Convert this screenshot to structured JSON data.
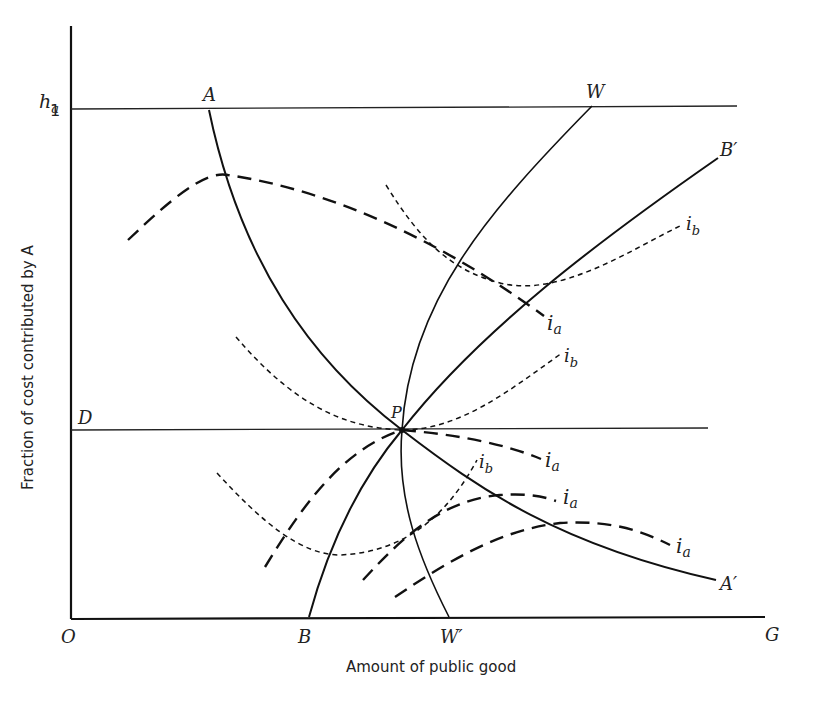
{
  "diagram": {
    "axes": {
      "y_symbol_main": "h",
      "y_symbol_sub": "a",
      "y_label": "Fraction of cost contributed by A",
      "x_label": "Amount of public good",
      "origin": "O",
      "x_end": "G",
      "y_tick_one": "1"
    },
    "points": {
      "A": "A",
      "W": "W",
      "B_prime": "B′",
      "A_prime": "A′",
      "P": "P",
      "D": "D",
      "B": "B",
      "W_prime": "W′"
    },
    "curve_labels": {
      "ia": "i",
      "ia_sub": "a",
      "ib": "i",
      "ib_sub": "b"
    },
    "colors": {
      "ink": "#111111",
      "background": "#ffffff"
    }
  }
}
